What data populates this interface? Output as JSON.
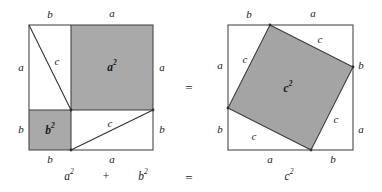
{
  "figure": {
    "colors": {
      "shade": "#a9a9a9",
      "shade_tilted": "#a4a4a4",
      "stroke": "#4a4a4a",
      "inner_stroke": "#3c3c3c",
      "background": "#ffffff",
      "text": "#1a1a1a"
    },
    "left_square": {
      "name": "a-squared-plus-b-squared-square",
      "labels": {
        "top_left_side": "b",
        "top_right_side": "a",
        "left_upper_side": "a",
        "left_lower_side": "b",
        "right_upper_side": "a",
        "right_lower_side": "b",
        "bottom_left_side": "b",
        "bottom_right_side": "a",
        "hyp_upper": "c",
        "hyp_lower": "c",
        "area_big": "a",
        "area_big_sup": "2",
        "area_small": "b",
        "area_small_sup": "2"
      }
    },
    "middle_equals": "=",
    "right_square": {
      "name": "c-squared-square",
      "labels": {
        "top_left_side": "b",
        "top_right_side": "a",
        "left_upper_side": "a",
        "left_lower_side": "b",
        "right_upper_side": "b",
        "right_lower_side": "a",
        "bottom_left_side": "a",
        "bottom_right_side": "b",
        "hyp_top": "c",
        "hyp_left": "c",
        "hyp_right": "c",
        "hyp_bottom": "c",
        "area": "c",
        "area_sup": "2"
      }
    },
    "equation": {
      "term1": "a",
      "term1_sup": "2",
      "plus": "+",
      "term2": "b",
      "term2_sup": "2",
      "equals": "=",
      "term3": "c",
      "term3_sup": "2"
    }
  }
}
